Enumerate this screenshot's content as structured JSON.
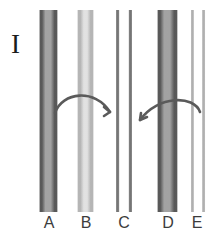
{
  "figure": {
    "panel_label": "I",
    "background_color": "#ffffff",
    "ink_color": "#3c3c3c"
  },
  "lanes": [
    {
      "id": "lane-a",
      "label": "A",
      "left": 39,
      "width": 19,
      "label_left": 41,
      "label_width": 16,
      "intensity": "dark",
      "description": "dark broad band with dense edges",
      "edge_color": "#4a4a4a",
      "fill_color": "#9a9a9a"
    },
    {
      "id": "lane-b",
      "label": "B",
      "left": 77,
      "width": 17,
      "label_left": 78,
      "label_width": 16,
      "intensity": "light",
      "description": "pale broad band with faint edges",
      "edge_color": "#a8a8a8",
      "fill_color": "#dcdcdc"
    },
    {
      "id": "lane-c",
      "label": "C",
      "left": 115,
      "width": 18,
      "label_left": 116,
      "label_width": 16,
      "intensity": "thin-pair",
      "description": "two thin medium-gray lines, hollow center",
      "edge_color": "#666666",
      "fill_color": "#ffffff"
    },
    {
      "id": "lane-d",
      "label": "D",
      "left": 157,
      "width": 21,
      "label_left": 160,
      "label_width": 16,
      "intensity": "dark",
      "description": "dark broad band with dense edges",
      "edge_color": "#4a4a4a",
      "fill_color": "#9a9a9a"
    },
    {
      "id": "lane-e",
      "label": "E",
      "left": 190,
      "width": 16,
      "label_left": 189,
      "label_width": 16,
      "intensity": "thin-pair-light",
      "description": "two thin pale lines, hollow center",
      "edge_color": "#9c9c9c",
      "fill_color": "#ffffff"
    }
  ],
  "arrows": [
    {
      "id": "arrow-a-to-c",
      "from_lane": "A",
      "to_lane": "C",
      "direction": "right",
      "path": "M 55 113 C 62 92, 95 88, 110 112",
      "head": "M 110 112 L 104 107 M 110 112 L 104 116",
      "color": "#5a5a5a"
    },
    {
      "id": "arrow-e-to-d",
      "from_lane": "E",
      "to_lane": "D",
      "direction": "left",
      "path": "M 200 112 C 194 95, 158 95, 140 120",
      "head": "M 140 120 L 147 117 M 140 120 L 141 113",
      "color": "#5a5a5a"
    }
  ]
}
